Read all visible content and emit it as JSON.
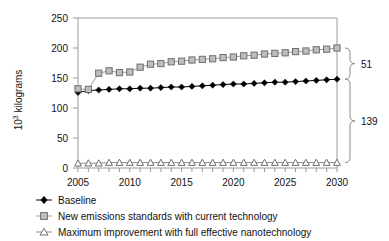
{
  "chart_data": {
    "type": "line",
    "title": "",
    "xlabel": "",
    "ylabel": "10³ kilograms",
    "ylabel_base": "10",
    "ylabel_sup": "3",
    "ylabel_rest": " kilograms",
    "xlim": [
      2005,
      2030
    ],
    "ylim": [
      0,
      250
    ],
    "grid": false,
    "legend_position": "below",
    "ytick_labels": [
      "250",
      "200",
      "150",
      "100",
      "50",
      "0"
    ],
    "ytick_values": [
      250,
      200,
      150,
      100,
      50,
      0
    ],
    "xtick_labels": [
      "2005",
      "2010",
      "2015",
      "2020",
      "2025",
      "2030"
    ],
    "xtick_values": [
      2005,
      2010,
      2015,
      2020,
      2025,
      2030
    ],
    "x": [
      2005,
      2006,
      2007,
      2008,
      2009,
      2010,
      2011,
      2012,
      2013,
      2014,
      2015,
      2016,
      2017,
      2018,
      2019,
      2020,
      2021,
      2022,
      2023,
      2024,
      2025,
      2026,
      2027,
      2028,
      2029,
      2030
    ],
    "series": [
      {
        "name": "Baseline",
        "marker": "filled-diamond",
        "color": "#000000",
        "values": [
          126,
          129,
          130,
          131,
          132,
          132,
          133,
          133,
          134,
          135,
          135,
          136,
          137,
          138,
          139,
          140,
          140,
          141,
          142,
          143,
          143,
          144,
          145,
          146,
          147,
          148
        ]
      },
      {
        "name": "New emissions standards with current technology",
        "marker": "gray-square",
        "color": "#bdbdbd",
        "values": [
          132,
          131,
          158,
          162,
          159,
          160,
          168,
          173,
          174,
          177,
          178,
          180,
          181,
          182,
          184,
          185,
          187,
          188,
          190,
          191,
          192,
          194,
          195,
          197,
          198,
          200
        ]
      },
      {
        "name": "Maximum improvement with full effective nanotechnology",
        "marker": "open-triangle",
        "color": "#ffffff",
        "values": [
          8,
          8,
          8,
          9,
          9,
          9,
          9,
          9,
          9,
          9,
          9,
          9,
          9,
          9,
          9,
          9,
          9,
          9,
          9,
          9,
          9,
          9,
          9,
          9,
          9,
          9
        ]
      }
    ],
    "annotations": [
      {
        "label": "51",
        "from": 148,
        "to": 200,
        "side": "right",
        "note": "gap between Baseline and New emissions standards at 2030"
      },
      {
        "label": "139",
        "from": 9,
        "to": 148,
        "side": "right",
        "note": "gap between Maximum improvement and Baseline at 2030"
      }
    ]
  },
  "legend": {
    "items": [
      {
        "label": "Baseline",
        "marker": "filled-diamond"
      },
      {
        "label": "New emissions standards with current technology",
        "marker": "gray-square"
      },
      {
        "label": "Maximum improvement with full effective nanotechnology",
        "marker": "open-triangle"
      }
    ]
  }
}
